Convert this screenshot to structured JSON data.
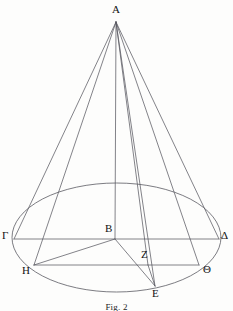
{
  "figure": {
    "caption": "Fig. 2",
    "caption_top": 302,
    "stroke_color": "#5a5a62",
    "label_color": "#111111",
    "background_color": "#fdfdfc",
    "width": 233,
    "height": 311
  },
  "points": [
    {
      "id": "A",
      "label": "A",
      "x": 116,
      "y": 22,
      "label_x": 112,
      "label_y": 4
    },
    {
      "id": "B",
      "label": "B",
      "x": 115,
      "y": 239,
      "label_x": 105,
      "label_y": 223
    },
    {
      "id": "Gamma",
      "label": "Γ",
      "x": 14,
      "y": 239,
      "label_x": 2,
      "label_y": 230
    },
    {
      "id": "Delta",
      "label": "Δ",
      "x": 219,
      "y": 239,
      "label_x": 221,
      "label_y": 230
    },
    {
      "id": "H",
      "label": "H",
      "x": 34,
      "y": 265,
      "label_x": 22,
      "label_y": 265
    },
    {
      "id": "Theta",
      "label": "Θ",
      "x": 199,
      "y": 265,
      "label_x": 203,
      "label_y": 264
    },
    {
      "id": "Z",
      "label": "Z",
      "x": 148,
      "y": 265,
      "label_x": 141,
      "label_y": 249
    },
    {
      "id": "E",
      "label": "E",
      "x": 155,
      "y": 286,
      "label_x": 152,
      "label_y": 288
    }
  ],
  "ellipse": {
    "name": "base-circle",
    "cx": 116.5,
    "cy": 237.5,
    "rx": 104.5,
    "ry": 54.5
  },
  "segments": [
    {
      "name": "apex-to-gamma",
      "from": "A",
      "to": "Gamma"
    },
    {
      "name": "apex-to-delta",
      "from": "A",
      "to": "Delta"
    },
    {
      "name": "apex-to-h",
      "from": "A",
      "to": "H"
    },
    {
      "name": "apex-to-theta",
      "from": "A",
      "to": "Theta"
    },
    {
      "name": "apex-axis-to-b",
      "from": "A",
      "to": "B"
    },
    {
      "name": "apex-to-z",
      "from": "A",
      "to": "Z"
    },
    {
      "name": "apex-to-e",
      "from": "A",
      "to": "E"
    },
    {
      "name": "gamma-to-delta",
      "from": "Gamma",
      "to": "Delta"
    },
    {
      "name": "h-to-theta",
      "from": "H",
      "to": "Theta"
    },
    {
      "name": "b-to-h",
      "from": "B",
      "to": "H"
    },
    {
      "name": "b-to-e",
      "from": "B",
      "to": "E"
    },
    {
      "name": "z-to-e",
      "from": "Z",
      "to": "E"
    }
  ],
  "chart_data": {
    "type": "diagram",
    "title": "Fig. 2",
    "shape": "cone with elliptical base",
    "vertices": {
      "A": [
        116,
        22
      ],
      "B": [
        115,
        239
      ],
      "Γ": [
        14,
        239
      ],
      "Δ": [
        219,
        239
      ],
      "H": [
        34,
        265
      ],
      "Θ": [
        199,
        265
      ],
      "Z": [
        148,
        265
      ],
      "E": [
        155,
        286
      ]
    },
    "edges": [
      [
        "A",
        "Γ"
      ],
      [
        "A",
        "Δ"
      ],
      [
        "A",
        "H"
      ],
      [
        "A",
        "Θ"
      ],
      [
        "A",
        "B"
      ],
      [
        "A",
        "Z"
      ],
      [
        "A",
        "E"
      ],
      [
        "Γ",
        "Δ"
      ],
      [
        "H",
        "Θ"
      ],
      [
        "B",
        "H"
      ],
      [
        "B",
        "E"
      ],
      [
        "Z",
        "E"
      ]
    ],
    "base_ellipse": {
      "center": [
        116.5,
        237.5
      ],
      "rx": 104.5,
      "ry": 54.5
    }
  }
}
